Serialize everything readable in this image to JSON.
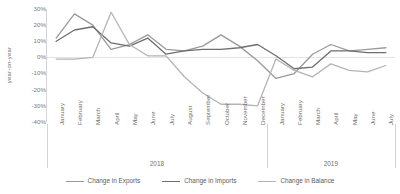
{
  "chart_data": {
    "type": "line",
    "title": "",
    "xlabel": "",
    "ylabel": "year-on-year",
    "ylim": [
      -40,
      30
    ],
    "grid": false,
    "legend_position": "bottom",
    "categories": [
      "January",
      "February",
      "March",
      "April",
      "May",
      "June",
      "July",
      "August",
      "September",
      "October",
      "November",
      "December",
      "January",
      "February",
      "March",
      "April",
      "May",
      "June",
      "July"
    ],
    "group_labels": [
      "2018",
      "2019"
    ],
    "group_spans": [
      12,
      7
    ],
    "y_ticks": [
      "30%",
      "20%",
      "10%",
      "0%",
      "-10%",
      "-20%",
      "-30%",
      "-40%"
    ],
    "y_tick_values": [
      30,
      20,
      10,
      0,
      -10,
      -20,
      -30,
      -40
    ],
    "series": [
      {
        "name": "Change in Exports",
        "color": "#9a9a9a",
        "values": [
          12,
          27,
          20,
          5,
          8,
          14,
          5,
          4,
          7,
          14,
          7,
          -2,
          -13,
          -10,
          2,
          8,
          4,
          5,
          6
        ]
      },
      {
        "name": "Change in Imports",
        "color": "#6e6e6e",
        "values": [
          10,
          17,
          19,
          9,
          7,
          12,
          2,
          4,
          5,
          5,
          6,
          8,
          1,
          -7,
          -6,
          4,
          4,
          3,
          3
        ]
      },
      {
        "name": "Change in Balance",
        "color": "#b4b4b4",
        "values": [
          -1,
          -1,
          0,
          28,
          8,
          1,
          1,
          -12,
          -22,
          -29,
          -29,
          -30,
          -1,
          -8,
          -12,
          -4,
          -8,
          -9,
          -5
        ]
      }
    ]
  },
  "axis": {
    "y_title": "year-on-year"
  },
  "legend": {
    "items": [
      {
        "label": "Change in Exports"
      },
      {
        "label": "Change in Imports"
      },
      {
        "label": "Change in Balance"
      }
    ]
  }
}
